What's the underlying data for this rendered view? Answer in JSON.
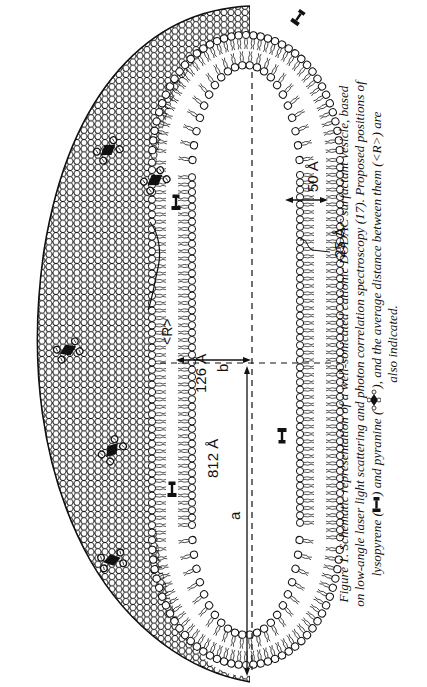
{
  "figure": {
    "orientation": "rotated 90 degrees counter-clockwise",
    "labels": {
      "a_dimension": "812 Å",
      "a_symbol": "a",
      "b_dimension": "126 Å",
      "b_symbol": "b",
      "bilayer_thickness": "50 Å",
      "monolayer_thickness": "25 Å",
      "probe_distance": "<R>"
    },
    "probes": {
      "pyranine_count_visible": 5,
      "lysopyrene_count_visible": 5
    },
    "colors": {
      "ink": "#111111",
      "background": "#ffffff"
    }
  },
  "caption": {
    "figure_label": "Figure 1.",
    "line1": "Figure 1.  Schematic representation of a well-sonicated cationic DODAC surfactant vesicle, based",
    "line2": "on low-angle laser light scattering and photon correlation spectroscopy (17).  Proposed positions of",
    "line3_before": "lysopyrene (",
    "line3_middle": ") and pyranine (",
    "line3_after": "), and the average distance between them (<R>) are",
    "line4": "also indicated."
  }
}
